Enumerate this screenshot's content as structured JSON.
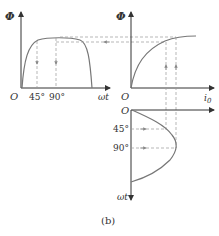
{
  "figure": {
    "caption": "(b)",
    "left_plot": {
      "y_label": "Φ",
      "x_label": "ωt",
      "origin": "O",
      "ticks": [
        "45°",
        "90°"
      ]
    },
    "right_plot": {
      "y_label": "Φ",
      "x_label": "i0",
      "x_label_main": "i",
      "x_label_sub": "0",
      "origin": "O"
    },
    "bottom_plot": {
      "origin": "O",
      "y_label": "ωt",
      "ticks": [
        "45°",
        "90°"
      ]
    },
    "colors": {
      "curve": "#777777",
      "axis": "#333333",
      "dashed": "#999999"
    }
  }
}
